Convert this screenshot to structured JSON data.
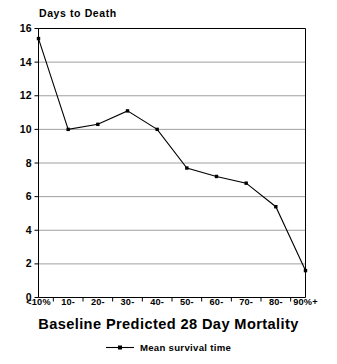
{
  "chart_data": {
    "type": "line",
    "title": "",
    "ylabel": "Days to Death",
    "xlabel": "Baseline Predicted 28 Day Mortality",
    "categories": [
      "<10%",
      "10-",
      "20-",
      "30-",
      "40-",
      "50-",
      "60-",
      "70-",
      "80-",
      "90%+"
    ],
    "series": [
      {
        "name": "Mean survival time",
        "values": [
          15.4,
          10.0,
          10.3,
          11.1,
          10.0,
          7.7,
          7.2,
          6.8,
          5.4,
          1.6
        ]
      }
    ],
    "ylim": [
      0,
      16
    ],
    "yticks": [
      0,
      2,
      4,
      6,
      8,
      10,
      12,
      14,
      16
    ],
    "ytick_labels": [
      "0",
      "2",
      "4",
      "6",
      "8",
      "10",
      "12",
      "14",
      "16"
    ],
    "grid": "horizontal",
    "legend_position": "bottom-center",
    "marker": "filled-square",
    "line_color": "#000000",
    "grid_color": "#888888",
    "axis_color": "#000000",
    "background_color": "#ffffff"
  },
  "legend": {
    "entries": [
      {
        "label": "Mean survival time",
        "symbol_name": "line-with-marker"
      }
    ]
  }
}
